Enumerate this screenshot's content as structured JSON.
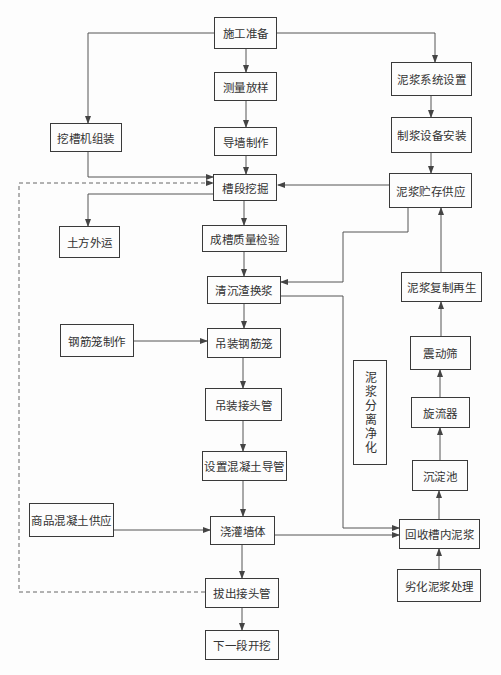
{
  "diagram": {
    "type": "flowchart",
    "nodes": [
      {
        "id": "prep",
        "label": "施工准备",
        "x": 214,
        "y": 17,
        "w": 63,
        "h": 32
      },
      {
        "id": "survey",
        "label": "测量放样",
        "x": 214,
        "y": 72,
        "w": 63,
        "h": 29
      },
      {
        "id": "guidewall",
        "label": "导墙制作",
        "x": 214,
        "y": 127,
        "w": 63,
        "h": 29
      },
      {
        "id": "machine",
        "label": "挖槽机组装",
        "x": 50,
        "y": 123,
        "w": 72,
        "h": 29
      },
      {
        "id": "excavate",
        "label": "槽段挖掘",
        "x": 213,
        "y": 174,
        "w": 64,
        "h": 27
      },
      {
        "id": "slurry_sys",
        "label": "泥浆系统设置",
        "x": 391,
        "y": 62,
        "w": 81,
        "h": 34
      },
      {
        "id": "slurry_equip",
        "label": "制浆设备安装",
        "x": 391,
        "y": 117,
        "w": 81,
        "h": 36
      },
      {
        "id": "slurry_store",
        "label": "泥浆贮存供应",
        "x": 389,
        "y": 173,
        "w": 83,
        "h": 35
      },
      {
        "id": "soil_out",
        "label": "土方外运",
        "x": 59,
        "y": 226,
        "w": 61,
        "h": 32
      },
      {
        "id": "quality",
        "label": "成槽质量检验",
        "x": 202,
        "y": 225,
        "w": 85,
        "h": 27
      },
      {
        "id": "clean",
        "label": "清沉渣换浆",
        "x": 207,
        "y": 276,
        "w": 74,
        "h": 28
      },
      {
        "id": "rebar_make",
        "label": "钢筋笼制作",
        "x": 60,
        "y": 324,
        "w": 74,
        "h": 33
      },
      {
        "id": "rebar_lift",
        "label": "吊装钢筋笼",
        "x": 207,
        "y": 328,
        "w": 74,
        "h": 30
      },
      {
        "id": "joint_lift",
        "label": "吊装接头管",
        "x": 205,
        "y": 388,
        "w": 77,
        "h": 33
      },
      {
        "id": "tremie",
        "label": "设置混凝土导管",
        "x": 202,
        "y": 451,
        "w": 85,
        "h": 30
      },
      {
        "id": "regen",
        "label": "泥浆复制再生",
        "x": 401,
        "y": 272,
        "w": 81,
        "h": 30
      },
      {
        "id": "shaker",
        "label": "震动筛",
        "x": 410,
        "y": 336,
        "w": 61,
        "h": 34
      },
      {
        "id": "cyclone",
        "label": "旋流器",
        "x": 411,
        "y": 397,
        "w": 59,
        "h": 31
      },
      {
        "id": "separate",
        "label": "泥浆分离净化",
        "x": 353,
        "y": 360,
        "w": 34,
        "h": 105,
        "vertical": true
      },
      {
        "id": "settle",
        "label": "沉淀池",
        "x": 412,
        "y": 460,
        "w": 56,
        "h": 31
      },
      {
        "id": "recover",
        "label": "回收槽内泥浆",
        "x": 399,
        "y": 519,
        "w": 81,
        "h": 30
      },
      {
        "id": "concrete_supply",
        "label": "商品混凝土供应",
        "x": 29,
        "y": 503,
        "w": 85,
        "h": 34
      },
      {
        "id": "pour",
        "label": "浇灌墙体",
        "x": 210,
        "y": 516,
        "w": 65,
        "h": 29
      },
      {
        "id": "bad_slurry",
        "label": "劣化泥浆处理",
        "x": 397,
        "y": 569,
        "w": 84,
        "h": 33
      },
      {
        "id": "pull_joint",
        "label": "拔出接头管",
        "x": 205,
        "y": 578,
        "w": 74,
        "h": 30
      },
      {
        "id": "next",
        "label": "下一段开挖",
        "x": 205,
        "y": 630,
        "w": 74,
        "h": 30
      }
    ],
    "edges": [
      {
        "from": "prep",
        "to": "survey",
        "style": "solid"
      },
      {
        "from": "survey",
        "to": "guidewall",
        "style": "solid"
      },
      {
        "from": "guidewall",
        "to": "excavate",
        "style": "solid"
      },
      {
        "from": "prep",
        "to": "machine",
        "style": "solid"
      },
      {
        "from": "prep",
        "to": "slurry_sys",
        "style": "solid"
      },
      {
        "from": "machine",
        "to": "excavate",
        "style": "solid"
      },
      {
        "from": "slurry_sys",
        "to": "slurry_equip",
        "style": "solid"
      },
      {
        "from": "slurry_equip",
        "to": "slurry_store",
        "style": "solid"
      },
      {
        "from": "slurry_store",
        "to": "excavate",
        "style": "solid"
      },
      {
        "from": "slurry_store",
        "to": "clean",
        "style": "solid"
      },
      {
        "from": "excavate",
        "to": "soil_out",
        "style": "solid"
      },
      {
        "from": "excavate",
        "to": "quality",
        "style": "solid"
      },
      {
        "from": "quality",
        "to": "clean",
        "style": "solid"
      },
      {
        "from": "clean",
        "to": "rebar_lift",
        "style": "solid"
      },
      {
        "from": "clean",
        "to": "recover",
        "style": "solid"
      },
      {
        "from": "rebar_make",
        "to": "rebar_lift",
        "style": "solid"
      },
      {
        "from": "rebar_lift",
        "to": "joint_lift",
        "style": "solid"
      },
      {
        "from": "joint_lift",
        "to": "tremie",
        "style": "solid"
      },
      {
        "from": "tremie",
        "to": "pour",
        "style": "solid"
      },
      {
        "from": "concrete_supply",
        "to": "pour",
        "style": "solid"
      },
      {
        "from": "pour",
        "to": "recover",
        "style": "solid"
      },
      {
        "from": "pour",
        "to": "pull_joint",
        "style": "solid"
      },
      {
        "from": "pull_joint",
        "to": "next",
        "style": "solid"
      },
      {
        "from": "pull_joint",
        "to": "excavate",
        "style": "dashed"
      },
      {
        "from": "bad_slurry",
        "to": "recover",
        "style": "solid"
      },
      {
        "from": "recover",
        "to": "settle",
        "style": "solid"
      },
      {
        "from": "settle",
        "to": "cyclone",
        "style": "solid"
      },
      {
        "from": "cyclone",
        "to": "shaker",
        "style": "solid"
      },
      {
        "from": "shaker",
        "to": "regen",
        "style": "solid"
      },
      {
        "from": "regen",
        "to": "slurry_store",
        "style": "solid"
      }
    ],
    "colors": {
      "line": "#555555",
      "box_border": "#3a3a3a",
      "text": "#333333",
      "background": "#fdfdfd"
    }
  }
}
